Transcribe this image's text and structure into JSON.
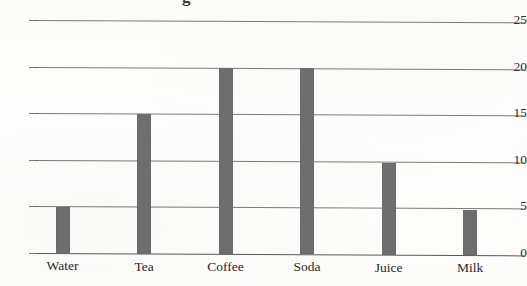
{
  "chart_data": {
    "type": "bar",
    "title": "",
    "title_visible_fragment": "g",
    "title_note": "Chart title is cropped off the top edge of the screenshot; only a small fragment of one glyph is visible.",
    "xlabel": "",
    "ylabel": "",
    "categories": [
      "Water",
      "Tea",
      "Coffee",
      "Soda",
      "Juice",
      "Milk"
    ],
    "values": [
      5,
      15,
      20,
      20,
      9.8,
      4.8
    ],
    "ylim": [
      0,
      25
    ],
    "ytick_labels": [
      "0",
      "5",
      "10",
      "15",
      "20",
      "25"
    ],
    "ytick_values": [
      0,
      5,
      10,
      15,
      20,
      25
    ],
    "grid": "horizontal",
    "legend": "none",
    "bar_color": "#6e6e6e",
    "axis_color": "#5e5e5e",
    "background_color": "#fdfdfb"
  },
  "axes": {
    "y_ticks": [
      {
        "label": "25",
        "value": 25
      },
      {
        "label": "20",
        "value": 20
      },
      {
        "label": "15",
        "value": 15
      },
      {
        "label": "10",
        "value": 10
      },
      {
        "label": "5",
        "value": 5
      },
      {
        "label": "0",
        "value": 0
      }
    ],
    "x_ticks": [
      {
        "label": "Water",
        "value": 5
      },
      {
        "label": "Tea",
        "value": 15
      },
      {
        "label": "Coffee",
        "value": 20
      },
      {
        "label": "Soda",
        "value": 20
      },
      {
        "label": "Juice",
        "value": 9.8
      },
      {
        "label": "Milk",
        "value": 4.8
      }
    ]
  }
}
